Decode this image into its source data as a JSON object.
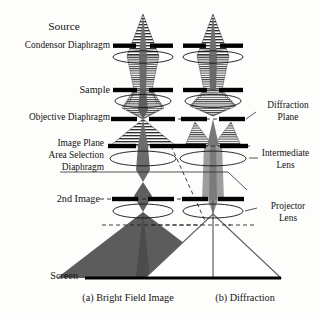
{
  "figure": {
    "background": "#fdfdfc",
    "ink": "#141414",
    "beam_dark": "#5a5a5a",
    "beam_light": "#b9b9b9",
    "aperture_color": "#000000"
  },
  "labels": {
    "source": "Source",
    "condensor_diaphragm": "Condensor Diaphragm",
    "sample": "Sample",
    "objective_diaphragm": "Objective Diaphragm",
    "image_plane": "Image Plane",
    "area_selection": "Area Selection",
    "diaphragm": "Diaphragm",
    "second_image": "2nd Image",
    "screen": "Screen",
    "diffraction_plane_line1": "Diffraction",
    "diffraction_plane_line2": "Plane",
    "intermediate_lens_line1": "Intermediate",
    "intermediate_lens_line2": "Lens",
    "projector_lens_line1": "Projector",
    "projector_lens_line2": "Lens"
  },
  "captions": {
    "a": "(a) Bright Field Image",
    "b": "(b) Diffraction"
  },
  "columns": [
    {
      "id": "bright-field",
      "caption_key": "a",
      "axis_x": 143
    },
    {
      "id": "diffraction",
      "caption_key": "b",
      "axis_x": 213
    }
  ],
  "optical_elements": [
    {
      "name": "condensor-diaphragm",
      "y": 46,
      "kind": "aperture"
    },
    {
      "name": "condensor-lens",
      "y": 56,
      "kind": "lens"
    },
    {
      "name": "sample",
      "y": 90,
      "kind": "aperture"
    },
    {
      "name": "objective-lens",
      "y": 100,
      "kind": "lens"
    },
    {
      "name": "objective-diaphragm",
      "y": 119,
      "kind": "aperture"
    },
    {
      "name": "image-plane-area-selection-diaphragm",
      "y": 146,
      "kind": "aperture"
    },
    {
      "name": "intermediate-lens",
      "y": 158,
      "kind": "lens"
    },
    {
      "name": "second-image",
      "y": 199,
      "kind": "aperture"
    },
    {
      "name": "projector-lens",
      "y": 211,
      "kind": "lens"
    },
    {
      "name": "screen",
      "y": 278,
      "kind": "screen"
    }
  ],
  "screen_extent": {
    "x1": 85,
    "x2": 281,
    "y": 278
  }
}
